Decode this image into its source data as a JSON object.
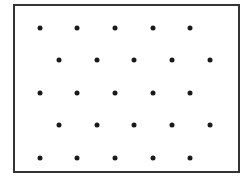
{
  "figure": {
    "width": 250,
    "height": 180,
    "background": "#ffffff",
    "frame": {
      "left": 13,
      "top": 4,
      "right": 240,
      "bottom": 173,
      "border_width": 2,
      "border_color": "#333333"
    },
    "dot_style": {
      "diameter": 5,
      "color": "#1a1a1a"
    },
    "rows": [
      {
        "y": 28,
        "xs": [
          40,
          77,
          115,
          153,
          190
        ]
      },
      {
        "y": 60,
        "xs": [
          59,
          97,
          134,
          172,
          210
        ]
      },
      {
        "y": 93,
        "xs": [
          40,
          77,
          115,
          153,
          190
        ]
      },
      {
        "y": 125,
        "xs": [
          59,
          97,
          134,
          172,
          210
        ]
      },
      {
        "y": 158,
        "xs": [
          40,
          77,
          115,
          153,
          190
        ]
      }
    ],
    "pattern": "staggered-hexagonal-dot-lattice",
    "dot_count": 25
  }
}
